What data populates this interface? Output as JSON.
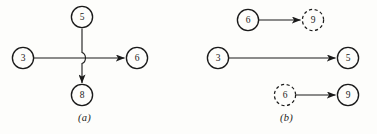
{
  "figure": {
    "type": "graph-diagram",
    "background_color": "#fdfdfb",
    "stroke_color": "#1a1a1a",
    "panels": [
      {
        "id": "a",
        "caption": "(a)",
        "description": "four-node crossing junction with line-hop",
        "nodes": [
          {
            "id": "a-top",
            "label": "5",
            "style": "solid",
            "cx": 82,
            "cy": 17
          },
          {
            "id": "a-left",
            "label": "3",
            "style": "solid",
            "cx": 23,
            "cy": 58
          },
          {
            "id": "a-right",
            "label": "6",
            "style": "solid",
            "cx": 137,
            "cy": 58
          },
          {
            "id": "a-bottom",
            "label": "8",
            "style": "solid",
            "cx": 82,
            "cy": 95
          }
        ],
        "edges": [
          {
            "id": "a-edge-vertical",
            "from": "5",
            "to": "8",
            "arrow": true,
            "orientation": "vertical",
            "hop": true
          },
          {
            "id": "a-edge-horizontal",
            "from": "3",
            "to": "6",
            "arrow": true,
            "orientation": "horizontal",
            "hop": false
          }
        ]
      },
      {
        "id": "b",
        "caption": "(b)",
        "description": "three independent directed pairs",
        "nodes": [
          {
            "id": "b-r1-src",
            "label": "6",
            "style": "solid",
            "cx": 61,
            "cy": 20
          },
          {
            "id": "b-r1-dst",
            "label": "9",
            "style": "dashed",
            "cx": 126,
            "cy": 20
          },
          {
            "id": "b-r2-src",
            "label": "3",
            "style": "solid",
            "cx": 31,
            "cy": 58
          },
          {
            "id": "b-r2-dst",
            "label": "5",
            "style": "solid",
            "cx": 161,
            "cy": 58
          },
          {
            "id": "b-r3-src",
            "label": "6",
            "style": "dashed",
            "cx": 98,
            "cy": 95
          },
          {
            "id": "b-r3-dst",
            "label": "9",
            "style": "solid",
            "cx": 161,
            "cy": 95
          }
        ],
        "edges": [
          {
            "id": "b-edge-row1",
            "from": "6",
            "to": "9",
            "arrow": true,
            "orientation": "horizontal"
          },
          {
            "id": "b-edge-row2",
            "from": "3",
            "to": "5",
            "arrow": true,
            "orientation": "horizontal"
          },
          {
            "id": "b-edge-row3",
            "from": "6",
            "to": "9",
            "arrow": true,
            "orientation": "horizontal"
          }
        ]
      }
    ]
  }
}
